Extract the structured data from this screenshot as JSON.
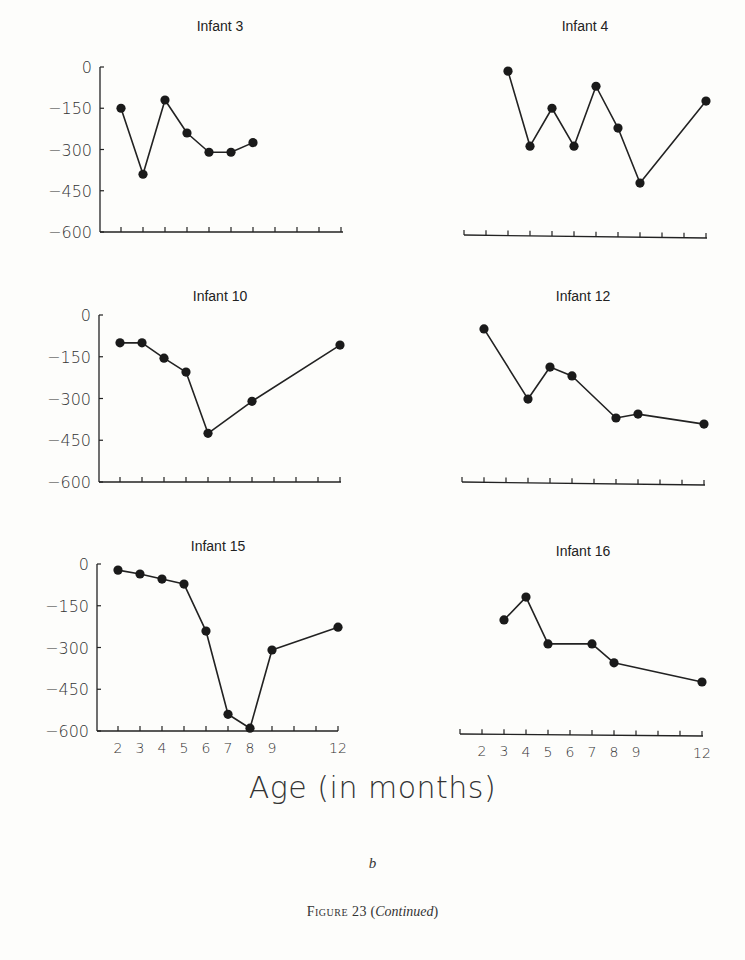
{
  "figure": {
    "x_axis_label": "Age (in months)",
    "panel_letter": "b",
    "caption_prefix": "Figure 23",
    "caption_paren_open": "(",
    "caption_suffix": "Continued",
    "caption_paren_close": ")",
    "line_color": "#222222",
    "marker_color": "#1a1a1a"
  },
  "chart_data": [
    {
      "type": "line",
      "title": "Infant 3",
      "xlabel": "Age (in months)",
      "ylabel": "",
      "ylim": [
        -600,
        0
      ],
      "yticks": [
        0,
        -150,
        -300,
        -450,
        -600
      ],
      "show_y_axis": true,
      "show_x_tick_labels": false,
      "x": [
        2,
        3,
        4,
        5,
        6,
        7,
        8
      ],
      "values": [
        -150,
        -390,
        -120,
        -240,
        -310,
        -310,
        -275
      ],
      "grid": false
    },
    {
      "type": "line",
      "title": "Infant 4",
      "xlabel": "Age (in months)",
      "ylabel": "",
      "ylim": [
        -600,
        0
      ],
      "yticks": [],
      "show_y_axis": false,
      "show_x_tick_labels": false,
      "x": [
        3,
        4,
        5,
        6,
        7,
        8,
        9,
        12
      ],
      "values": [
        -15,
        -288,
        -150,
        -288,
        -70,
        -222,
        -422,
        -124
      ],
      "grid": false
    },
    {
      "type": "line",
      "title": "Infant 10",
      "xlabel": "Age (in months)",
      "ylabel": "",
      "ylim": [
        -600,
        0
      ],
      "yticks": [
        0,
        -150,
        -300,
        -450,
        -600
      ],
      "show_y_axis": true,
      "show_x_tick_labels": false,
      "x": [
        2,
        3,
        4,
        5,
        6,
        8,
        12
      ],
      "values": [
        -100,
        -100,
        -155,
        -205,
        -425,
        -310,
        -108
      ],
      "grid": false
    },
    {
      "type": "line",
      "title": "Infant 12",
      "xlabel": "Age (in months)",
      "ylabel": "",
      "ylim": [
        -600,
        0
      ],
      "yticks": [],
      "show_y_axis": false,
      "show_x_tick_labels": false,
      "x": [
        2,
        4,
        5,
        6,
        8,
        9,
        12
      ],
      "values": [
        -50,
        -302,
        -187,
        -219,
        -370,
        -356,
        -392
      ],
      "grid": false
    },
    {
      "type": "line",
      "title": "Infant 15",
      "xlabel": "Age (in months)",
      "ylabel": "",
      "ylim": [
        -600,
        0
      ],
      "yticks": [
        0,
        -150,
        -300,
        -450,
        -600
      ],
      "show_y_axis": true,
      "show_x_tick_labels": true,
      "x_tick_labels": [
        "2",
        "3",
        "4",
        "5",
        "6",
        "7",
        "8",
        "9",
        "12"
      ],
      "x": [
        2,
        3,
        4,
        5,
        6,
        7,
        8,
        9,
        12
      ],
      "values": [
        -22,
        -36,
        -54,
        -72,
        -241,
        -540,
        -590,
        -309,
        -227
      ],
      "grid": false
    },
    {
      "type": "line",
      "title": "Infant 16",
      "xlabel": "Age (in months)",
      "ylabel": "",
      "ylim": [
        -600,
        0
      ],
      "yticks": [],
      "show_y_axis": false,
      "show_x_tick_labels": true,
      "x_tick_labels": [
        "2",
        "3",
        "4",
        "5",
        "6",
        "7",
        "8",
        "9",
        "12"
      ],
      "x": [
        3,
        4,
        5,
        7,
        8,
        12
      ],
      "values": [
        -201,
        -119,
        -287,
        -287,
        -355,
        -424
      ],
      "grid": false
    }
  ],
  "layout": {
    "panels": [
      {
        "name": "infant-3-chart",
        "title_x": 220,
        "title_y": 31,
        "y0": 67,
        "y600": 232,
        "axis_y": 232,
        "x_start": 100,
        "x_month2": 121,
        "x_step": 22,
        "x_end": 343,
        "ytick_label_x": 92,
        "axis_tilt": 0
      },
      {
        "name": "infant-4-chart",
        "title_x": 585,
        "title_y": 31,
        "y0": 67,
        "y600": 232,
        "axis_y": 235,
        "x_start": 464,
        "x_month2": 486,
        "x_step": 22,
        "x_end": 707,
        "ytick_label_x": 0,
        "axis_tilt": 3
      },
      {
        "name": "infant-10-chart",
        "title_x": 220,
        "title_y": 301,
        "y0": 315,
        "y600": 482,
        "axis_y": 482,
        "x_start": 99,
        "x_month2": 120,
        "x_step": 22,
        "x_end": 341,
        "ytick_label_x": 91,
        "axis_tilt": 0
      },
      {
        "name": "infant-12-chart",
        "title_x": 583,
        "title_y": 301,
        "y0": 315,
        "y600": 482,
        "axis_y": 482,
        "x_start": 462,
        "x_month2": 484,
        "x_step": 22,
        "x_end": 705,
        "ytick_label_x": 0,
        "axis_tilt": 3
      },
      {
        "name": "infant-15-chart",
        "title_x": 218,
        "title_y": 551,
        "y0": 564,
        "y600": 731,
        "axis_y": 731,
        "x_start": 97,
        "x_month2": 118,
        "x_step": 22,
        "x_end": 338,
        "ytick_label_x": 89,
        "axis_tilt": 0
      },
      {
        "name": "infant-16-chart",
        "title_x": 583,
        "title_y": 556,
        "y0": 564,
        "y600": 731,
        "axis_y": 734,
        "x_start": 460,
        "x_month2": 482,
        "x_step": 22,
        "x_end": 703,
        "ytick_label_x": 0,
        "axis_tilt": 2
      }
    ]
  }
}
